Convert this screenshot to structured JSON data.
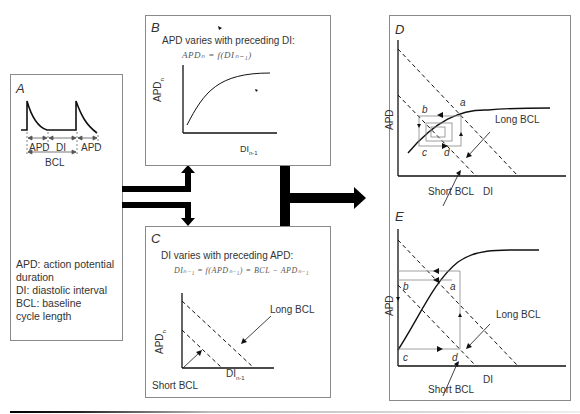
{
  "panels": {
    "A": {
      "label": "A",
      "waveform_labels": {
        "apd1": "APD",
        "di": "DI",
        "apd2": "APD",
        "bcl": "BCL"
      },
      "legend": [
        "APD: action potential duration",
        "DI: diastolic interval",
        "BCL: baseline cycle length"
      ]
    },
    "B": {
      "label": "B",
      "title": "APD varies with preceding DI:",
      "formula": "APDₙ = f(DIₙ₋₁)",
      "ylabel": "APD",
      "ylabel_sub": "n",
      "xlabel": "DI",
      "xlabel_sub": "n-1"
    },
    "C": {
      "label": "C",
      "title": "DI varies with preceding APD:",
      "formula": "DIₙ₋₁ = f(APDₙ₋₁) = BCL − APDₙ₋₁",
      "ylabel": "APD",
      "ylabel_sub": "n",
      "xlabel": "DI",
      "xlabel_sub": "n-1",
      "long_bcl": "Long BCL",
      "short_bcl": "Short BCL"
    },
    "D": {
      "label": "D",
      "ylabel": "APD",
      "xlabel": "DI",
      "points": {
        "a": "a",
        "b": "b",
        "c": "c",
        "d": "d"
      },
      "long_bcl": "Long BCL",
      "short_bcl": "Short BCL"
    },
    "E": {
      "label": "E",
      "ylabel": "APD",
      "xlabel": "DI",
      "points": {
        "a": "a",
        "b": "b",
        "c": "c",
        "d": "d"
      },
      "long_bcl": "Long BCL",
      "short_bcl": "Short BCL"
    }
  }
}
